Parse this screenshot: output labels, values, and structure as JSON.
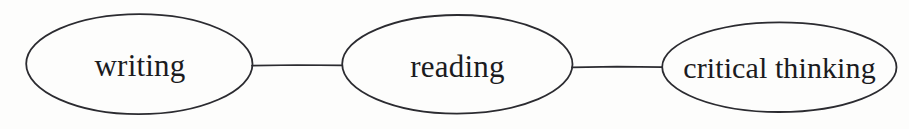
{
  "diagram": {
    "type": "concept-chain",
    "background_color": "#fdfdfc",
    "stroke_color": "#2b2b30",
    "text_color": "#1b1b1e",
    "nodes": [
      {
        "id": "writing",
        "label": "writing",
        "shape": "ellipse",
        "cx": 139,
        "cy": 64,
        "rx": 113,
        "ry": 50
      },
      {
        "id": "reading",
        "label": "reading",
        "shape": "ellipse",
        "cx": 457,
        "cy": 64,
        "rx": 115,
        "ry": 49
      },
      {
        "id": "critical-thinking",
        "label": "critical thinking",
        "shape": "ellipse",
        "cx": 779,
        "cy": 67,
        "rx": 117,
        "ry": 45
      }
    ],
    "connectors": [
      {
        "id": "writing-to-reading",
        "from": "writing",
        "to": "reading",
        "x1": 252,
        "x2": 342,
        "y": 65,
        "style": "solid"
      },
      {
        "id": "reading-to-critical-thinking",
        "from": "reading",
        "to": "critical-thinking",
        "x1": 572,
        "x2": 662,
        "y": 67,
        "style": "solid"
      }
    ]
  }
}
